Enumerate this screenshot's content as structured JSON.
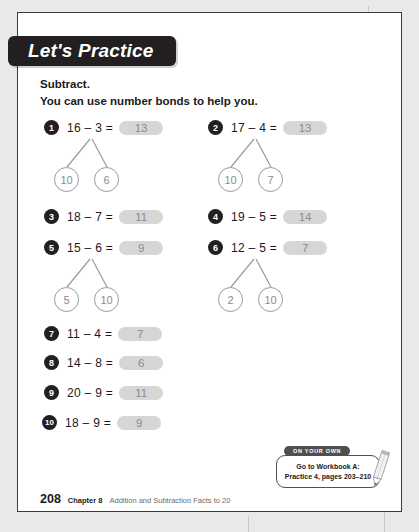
{
  "banner": {
    "title": "Let's Practice"
  },
  "instructions": {
    "line1": "Subtract.",
    "line2": "You can use number bonds to help you."
  },
  "problems": [
    {
      "number": "1",
      "expression": "16 – 3 =",
      "answer": "13",
      "bond": {
        "left": "10",
        "right": "6"
      }
    },
    {
      "number": "2",
      "expression": "17 – 4 =",
      "answer": "13",
      "bond": {
        "left": "10",
        "right": "7"
      }
    },
    {
      "number": "3",
      "expression": "18 – 7 =",
      "answer": "11",
      "bond": null
    },
    {
      "number": "4",
      "expression": "19 – 5 =",
      "answer": "14",
      "bond": null
    },
    {
      "number": "5",
      "expression": "15 – 6 =",
      "answer": "9",
      "bond": {
        "left": "5",
        "right": "10"
      }
    },
    {
      "number": "6",
      "expression": "12 – 5 =",
      "answer": "7",
      "bond": {
        "left": "2",
        "right": "10"
      }
    },
    {
      "number": "7",
      "expression": "11 – 4 =",
      "answer": "7",
      "bond": null
    },
    {
      "number": "8",
      "expression": "14 – 8 =",
      "answer": "6",
      "bond": null
    },
    {
      "number": "9",
      "expression": "20 – 9 =",
      "answer": "11",
      "bond": null
    },
    {
      "number": "10",
      "expression": "18 – 9 =",
      "answer": "9",
      "bond": null
    }
  ],
  "callout": {
    "tab_label": "ON YOUR OWN",
    "line1": "Go to Workbook A:",
    "line2": "Practice 4, pages 203–210"
  },
  "footer": {
    "page_number": "208",
    "chapter": "Chapter 8",
    "chapter_title": "Addition and Subtraction Facts to 20"
  },
  "colors": {
    "banner_bg": "#231f20",
    "answer_blank_bg": "#d6d6d6",
    "answer_text": "#8c8c8c",
    "bond_stroke": "#9a9a9a",
    "page_bg": "#e9e9e9"
  }
}
